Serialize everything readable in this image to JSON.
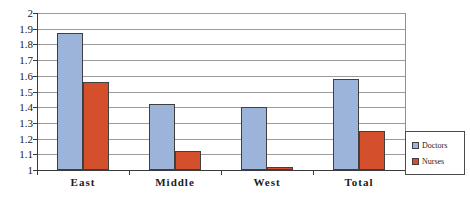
{
  "chart_data": {
    "type": "bar",
    "title": "",
    "xlabel": "",
    "ylabel": "",
    "categories": [
      "East",
      "Middle",
      "West",
      "Total"
    ],
    "series": [
      {
        "name": "Doctors",
        "color": "#9cb3da",
        "values": [
          1.87,
          1.42,
          1.4,
          1.58
        ]
      },
      {
        "name": "Nurses",
        "color": "#d4502c",
        "values": [
          1.56,
          1.12,
          1.02,
          1.25
        ]
      }
    ],
    "ylim": [
      1,
      2
    ],
    "ytick_step": 0.1,
    "ytick_labels": [
      "2",
      "1.9",
      "1.8",
      "1.7",
      "1.6",
      "1.5",
      "1.4",
      "1.3",
      "1.2",
      "1.1",
      "1"
    ],
    "grid": true,
    "legend_position": "right"
  }
}
